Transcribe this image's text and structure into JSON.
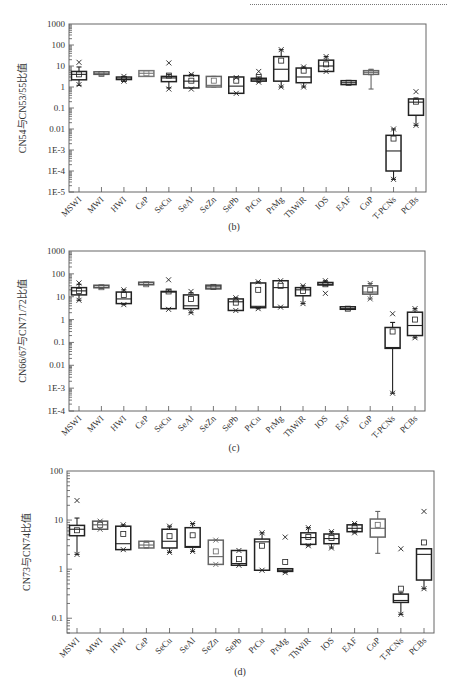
{
  "page": {
    "captions": [
      "(b)",
      "(c)",
      "(d)"
    ]
  },
  "chart_data": [
    {
      "id": "b",
      "type": "box",
      "title": "",
      "caption": "(b)",
      "xlabel": "",
      "ylabel": "CN54与CN53/55比值",
      "yscale": "log",
      "ylim": [
        1e-05,
        1000
      ],
      "yticks": [
        1000,
        100,
        10,
        1,
        0.1,
        0.01,
        0.001,
        0.0001,
        1e-05
      ],
      "ytick_labels": [
        "1000",
        "100",
        "10",
        "1",
        "0.1",
        "0.01",
        "1E-3",
        "1E-4",
        "1E-5"
      ],
      "categories": [
        "MSWI",
        "MWI",
        "HWI",
        "CeP",
        "SeCu",
        "SeAl",
        "SeZn",
        "SePb",
        "PrCu",
        "PrMg",
        "ThWiR",
        "IOS",
        "EAF",
        "CoP",
        "T-PCNs",
        "PCBs"
      ],
      "series": [
        {
          "name": "MSWI",
          "min": 1.2,
          "q1": 2.2,
          "median": 4,
          "q3": 5.5,
          "max": 9,
          "mean": 4,
          "outliers": [
            15,
            1.3
          ],
          "color": "#222222"
        },
        {
          "name": "MWI",
          "min": 3.7,
          "q1": 3.8,
          "median": 4.2,
          "q3": 4.6,
          "max": 4.8,
          "mean": 4.2,
          "outliers": [],
          "color": "#555555"
        },
        {
          "name": "HWI",
          "min": 1.9,
          "q1": 2.2,
          "median": 2.4,
          "q3": 2.6,
          "max": 3.2,
          "mean": 2.4,
          "outliers": [
            3.2,
            1.9
          ],
          "color": "#222222"
        },
        {
          "name": "CeP",
          "min": 3.2,
          "q1": 3.2,
          "median": 4.5,
          "q3": 6,
          "max": 6,
          "mean": 4.5,
          "outliers": [],
          "color": "#777777"
        },
        {
          "name": "SeCu",
          "min": 0.9,
          "q1": 1.8,
          "median": 2.7,
          "q3": 3.2,
          "max": 4,
          "mean": 3.5,
          "outliers": [
            14,
            0.8
          ],
          "color": "#222222"
        },
        {
          "name": "SeAl",
          "min": 0.9,
          "q1": 0.9,
          "median": 1.9,
          "q3": 3.5,
          "max": 4,
          "mean": 2,
          "outliers": [
            4,
            0.8
          ],
          "color": "#222222"
        },
        {
          "name": "SeZn",
          "min": 1,
          "q1": 1,
          "median": 1.2,
          "q3": 3.2,
          "max": 3.2,
          "mean": 2,
          "outliers": [],
          "color": "#666666"
        },
        {
          "name": "SePb",
          "min": 0.5,
          "q1": 0.5,
          "median": 1.1,
          "q3": 3,
          "max": 3,
          "mean": 2,
          "outliers": [
            2.8,
            0.5
          ],
          "color": "#222222"
        },
        {
          "name": "PrCu",
          "min": 1.7,
          "q1": 1.9,
          "median": 2.2,
          "q3": 2.6,
          "max": 3,
          "mean": 3,
          "outliers": [
            5.5,
            1.7
          ],
          "color": "#222222"
        },
        {
          "name": "PrMg",
          "min": 1,
          "q1": 1.9,
          "median": 7,
          "q3": 28,
          "max": 60,
          "mean": 18,
          "outliers": [
            60,
            1
          ],
          "color": "#222222"
        },
        {
          "name": "ThWiR",
          "min": 1,
          "q1": 1.6,
          "median": 3,
          "q3": 8,
          "max": 9,
          "mean": 6,
          "outliers": [
            9,
            1
          ],
          "color": "#222222"
        },
        {
          "name": "IOS",
          "min": 5.5,
          "q1": 5.5,
          "median": 10,
          "q3": 19,
          "max": 28,
          "mean": 12,
          "outliers": [
            28,
            5.5
          ],
          "color": "#222222"
        },
        {
          "name": "EAF",
          "min": 1.3,
          "q1": 1.3,
          "median": 1.6,
          "q3": 2,
          "max": 2,
          "mean": 1.6,
          "outliers": [],
          "color": "#222222"
        },
        {
          "name": "CoP",
          "min": 0.8,
          "q1": 4,
          "median": 5,
          "q3": 6,
          "max": 7,
          "mean": 5,
          "outliers": [],
          "color": "#666666"
        },
        {
          "name": "T-PCNs",
          "min": 4e-05,
          "q1": 0.0001,
          "median": 0.0009,
          "q3": 0.005,
          "max": 0.01,
          "mean": 0.0035,
          "outliers": [
            0.01,
            4e-05
          ],
          "color": "#222222"
        },
        {
          "name": "PCBs",
          "min": 0.015,
          "q1": 0.045,
          "median": 0.19,
          "q3": 0.27,
          "max": 0.3,
          "mean": 0.2,
          "outliers": [
            0.6,
            0.015
          ],
          "color": "#222222"
        }
      ]
    },
    {
      "id": "c",
      "type": "box",
      "title": "",
      "caption": "(c)",
      "xlabel": "",
      "ylabel": "CN66/67与CN71/72比值",
      "yscale": "log",
      "ylim": [
        0.0001,
        1000
      ],
      "yticks": [
        1000,
        100,
        10,
        1,
        0.1,
        0.01,
        0.001,
        0.0001
      ],
      "ytick_labels": [
        "1000",
        "100",
        "10",
        "1",
        "0.1",
        "0.01",
        "1E-3",
        "1E-4"
      ],
      "categories": [
        "MSWI",
        "MWI",
        "HWI",
        "CeP",
        "SeCu",
        "SeAl",
        "SeZn",
        "SePb",
        "PrCu",
        "PrMg",
        "ThWiR",
        "IOS",
        "EAF",
        "CoP",
        "T-PCNs",
        "PCBs"
      ],
      "series": [
        {
          "name": "MSWI",
          "min": 7,
          "q1": 12,
          "median": 18,
          "q3": 25,
          "max": 35,
          "mean": 18,
          "outliers": [
            40,
            7
          ],
          "color": "#222222"
        },
        {
          "name": "MWI",
          "min": 23,
          "q1": 24,
          "median": 26,
          "q3": 28,
          "max": 30,
          "mean": 26,
          "outliers": [],
          "color": "#555555"
        },
        {
          "name": "HWI",
          "min": 4.5,
          "q1": 5,
          "median": 8,
          "q3": 16,
          "max": 20,
          "mean": 12,
          "outliers": [
            20,
            4.5
          ],
          "color": "#222222"
        },
        {
          "name": "CeP",
          "min": 32,
          "q1": 32,
          "median": 35,
          "q3": 38,
          "max": 38,
          "mean": 35,
          "outliers": [],
          "color": "#555555"
        },
        {
          "name": "SeCu",
          "min": 3,
          "q1": 3,
          "median": 16,
          "q3": 17,
          "max": 20,
          "mean": 17,
          "outliers": [
            55,
            2.8
          ],
          "color": "#222222"
        },
        {
          "name": "SeAl",
          "min": 2,
          "q1": 3,
          "median": 4,
          "q3": 12,
          "max": 15,
          "mean": 8,
          "outliers": [
            17,
            2
          ],
          "color": "#222222"
        },
        {
          "name": "SeZn",
          "min": 22,
          "q1": 22,
          "median": 27,
          "q3": 32,
          "max": 32,
          "mean": 27,
          "outliers": [],
          "color": "#444444"
        },
        {
          "name": "SePb",
          "min": 2.5,
          "q1": 2.5,
          "median": 6,
          "q3": 8,
          "max": 9,
          "mean": 5.5,
          "outliers": [
            9,
            2.5
          ],
          "color": "#222222"
        },
        {
          "name": "PrCu",
          "min": 3,
          "q1": 3.3,
          "median": 3.8,
          "q3": 40,
          "max": 45,
          "mean": 20,
          "outliers": [
            45,
            3
          ],
          "color": "#222222"
        },
        {
          "name": "PrMg",
          "min": 3.5,
          "q1": 3.5,
          "median": 25,
          "q3": 50,
          "max": 50,
          "mean": 30,
          "outliers": [
            50,
            3.5
          ],
          "color": "#222222"
        },
        {
          "name": "ThWiR",
          "min": 5,
          "q1": 11,
          "median": 20,
          "q3": 25,
          "max": 30,
          "mean": 18,
          "outliers": [
            30,
            5
          ],
          "color": "#222222"
        },
        {
          "name": "IOS",
          "min": 32,
          "q1": 33,
          "median": 35,
          "q3": 37,
          "max": 50,
          "mean": 35,
          "outliers": [
            50,
            14
          ],
          "color": "#222222"
        },
        {
          "name": "EAF",
          "min": 2.7,
          "q1": 2.8,
          "median": 3,
          "q3": 3.2,
          "max": 3.3,
          "mean": 3,
          "outliers": [],
          "color": "#222222"
        },
        {
          "name": "CoP",
          "min": 8,
          "q1": 13,
          "median": 16,
          "q3": 30,
          "max": 38,
          "mean": 20,
          "outliers": [
            38,
            8
          ],
          "color": "#555555"
        },
        {
          "name": "T-PCNs",
          "min": 0.0006,
          "q1": 0.055,
          "median": 0.06,
          "q3": 0.45,
          "max": 0.75,
          "mean": 0.3,
          "outliers": [
            1.8,
            0.0006
          ],
          "color": "#222222"
        },
        {
          "name": "PCBs",
          "min": 0.16,
          "q1": 0.2,
          "median": 0.55,
          "q3": 2.1,
          "max": 3,
          "mean": 1,
          "outliers": [
            3,
            0.16
          ],
          "color": "#222222"
        }
      ]
    },
    {
      "id": "d",
      "type": "box",
      "title": "",
      "caption": "(d)",
      "xlabel": "",
      "ylabel": "CN73与CN74比值",
      "yscale": "log",
      "ylim": [
        0.05,
        100
      ],
      "yticks": [
        100,
        10,
        1,
        0.1
      ],
      "ytick_labels": [
        "100",
        "10",
        "1",
        "0.1"
      ],
      "categories": [
        "MSWI",
        "MWI",
        "HWI",
        "CeP",
        "SeCu",
        "SeAl",
        "SeZn",
        "SePb",
        "PrCu",
        "PrMg",
        "ThWiR",
        "IOS",
        "EAF",
        "CoP",
        "T-PCNs",
        "PCBs"
      ],
      "series": [
        {
          "name": "MSWI",
          "min": 2,
          "q1": 4.8,
          "median": 6.5,
          "q3": 7.8,
          "max": 11,
          "mean": 6.2,
          "outliers": [
            25,
            2
          ],
          "color": "#222222"
        },
        {
          "name": "MWI",
          "min": 6.5,
          "q1": 6.5,
          "median": 8,
          "q3": 9.5,
          "max": 9.5,
          "mean": 8,
          "outliers": [
            9.5,
            6.5
          ],
          "color": "#555555"
        },
        {
          "name": "HWI",
          "min": 2.5,
          "q1": 2.5,
          "median": 3.3,
          "q3": 7.5,
          "max": 8,
          "mean": 5.2,
          "outliers": [
            8,
            2.5
          ],
          "color": "#222222"
        },
        {
          "name": "CeP",
          "min": 2.7,
          "q1": 2.7,
          "median": 3.1,
          "q3": 3.7,
          "max": 3.7,
          "mean": 3.1,
          "outliers": [],
          "color": "#666666"
        },
        {
          "name": "SeCu",
          "min": 2.2,
          "q1": 2.7,
          "median": 3.7,
          "q3": 6.5,
          "max": 7.5,
          "mean": 4.7,
          "outliers": [
            7.5,
            2.2
          ],
          "color": "#222222"
        },
        {
          "name": "SeAl",
          "min": 2.3,
          "q1": 2.8,
          "median": 2.9,
          "q3": 7,
          "max": 8.5,
          "mean": 4.9,
          "outliers": [
            8.5,
            2.3
          ],
          "color": "#222222"
        },
        {
          "name": "SeZn",
          "min": 1.25,
          "q1": 1.25,
          "median": 1.8,
          "q3": 3.9,
          "max": 3.9,
          "mean": 2.3,
          "outliers": [
            3.9,
            1.25
          ],
          "color": "#666666"
        },
        {
          "name": "SePb",
          "min": 1.2,
          "q1": 1.2,
          "median": 1.3,
          "q3": 2.4,
          "max": 2.4,
          "mean": 1.6,
          "outliers": [
            2.4,
            1.2
          ],
          "color": "#222222"
        },
        {
          "name": "PrCu",
          "min": 0.95,
          "q1": 0.95,
          "median": 3.6,
          "q3": 4.1,
          "max": 5.5,
          "mean": 3,
          "outliers": [
            5.5,
            0.95
          ],
          "color": "#222222"
        },
        {
          "name": "PrMg",
          "min": 0.85,
          "q1": 0.9,
          "median": 0.95,
          "q3": 1.02,
          "max": 1.02,
          "mean": 1.4,
          "outliers": [
            4.5,
            0.85
          ],
          "color": "#222222"
        },
        {
          "name": "ThWiR",
          "min": 3,
          "q1": 3.2,
          "median": 4.4,
          "q3": 5.5,
          "max": 7,
          "mean": 4.5,
          "outliers": [
            7,
            3
          ],
          "color": "#222222"
        },
        {
          "name": "IOS",
          "min": 2.7,
          "q1": 3.3,
          "median": 4.2,
          "q3": 5.2,
          "max": 5.8,
          "mean": 4.3,
          "outliers": [
            5.8,
            2.7
          ],
          "color": "#222222"
        },
        {
          "name": "EAF",
          "min": 5.5,
          "q1": 5.8,
          "median": 6.8,
          "q3": 8,
          "max": 8.5,
          "mean": 6.8,
          "outliers": [
            8.5,
            5.5
          ],
          "color": "#222222"
        },
        {
          "name": "CoP",
          "min": 2.1,
          "q1": 4.5,
          "median": 6.8,
          "q3": 10.5,
          "max": 15,
          "mean": 8,
          "outliers": [],
          "color": "#666666"
        },
        {
          "name": "T-PCNs",
          "min": 0.12,
          "q1": 0.21,
          "median": 0.23,
          "q3": 0.31,
          "max": 0.33,
          "mean": 0.4,
          "outliers": [
            2.6,
            0.12
          ],
          "color": "#222222"
        },
        {
          "name": "PCBs",
          "min": 0.4,
          "q1": 0.6,
          "median": 2,
          "q3": 2.6,
          "max": 2.6,
          "mean": 3.5,
          "outliers": [
            15,
            0.4
          ],
          "color": "#222222"
        }
      ]
    }
  ]
}
